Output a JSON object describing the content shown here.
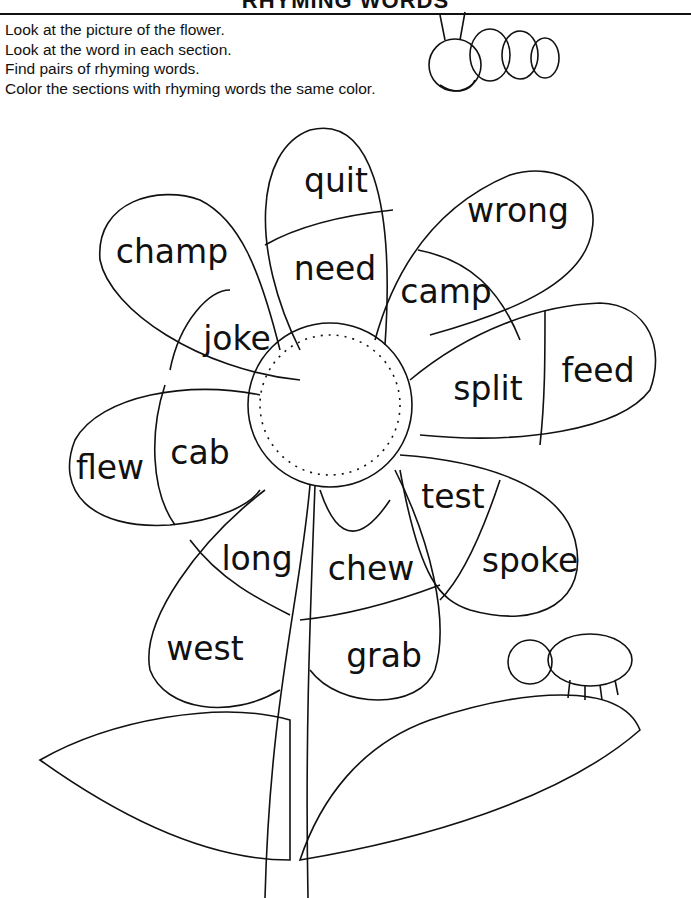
{
  "worksheet": {
    "title": "RHYMING WORDS",
    "instructions": [
      "Look at the picture of the flower.",
      "Look at the word in each section.",
      "Find pairs of rhyming words.",
      "Color the sections with rhyming words the same color."
    ]
  },
  "flower": {
    "sections": [
      {
        "id": "quit",
        "word": "quit",
        "x": 336,
        "y": 180
      },
      {
        "id": "need",
        "word": "need",
        "x": 335,
        "y": 268
      },
      {
        "id": "champ",
        "word": "champ",
        "x": 172,
        "y": 251
      },
      {
        "id": "joke",
        "word": "joke",
        "x": 237,
        "y": 338
      },
      {
        "id": "wrong",
        "word": "wrong",
        "x": 518,
        "y": 210
      },
      {
        "id": "camp",
        "word": "camp",
        "x": 446,
        "y": 291
      },
      {
        "id": "split",
        "word": "split",
        "x": 488,
        "y": 388
      },
      {
        "id": "feed",
        "word": "feed",
        "x": 598,
        "y": 370
      },
      {
        "id": "flew",
        "word": "flew",
        "x": 110,
        "y": 467
      },
      {
        "id": "cab",
        "word": "cab",
        "x": 200,
        "y": 452
      },
      {
        "id": "test",
        "word": "test",
        "x": 453,
        "y": 496
      },
      {
        "id": "spoke",
        "word": "spoke",
        "x": 530,
        "y": 560
      },
      {
        "id": "long",
        "word": "long",
        "x": 257,
        "y": 558
      },
      {
        "id": "chew",
        "word": "chew",
        "x": 371,
        "y": 568
      },
      {
        "id": "west",
        "word": "west",
        "x": 205,
        "y": 648
      },
      {
        "id": "grab",
        "word": "grab",
        "x": 384,
        "y": 655
      }
    ]
  },
  "illustrations": [
    "bee-icon",
    "caterpillar-icon",
    "leaf",
    "stem",
    "flower-center"
  ]
}
